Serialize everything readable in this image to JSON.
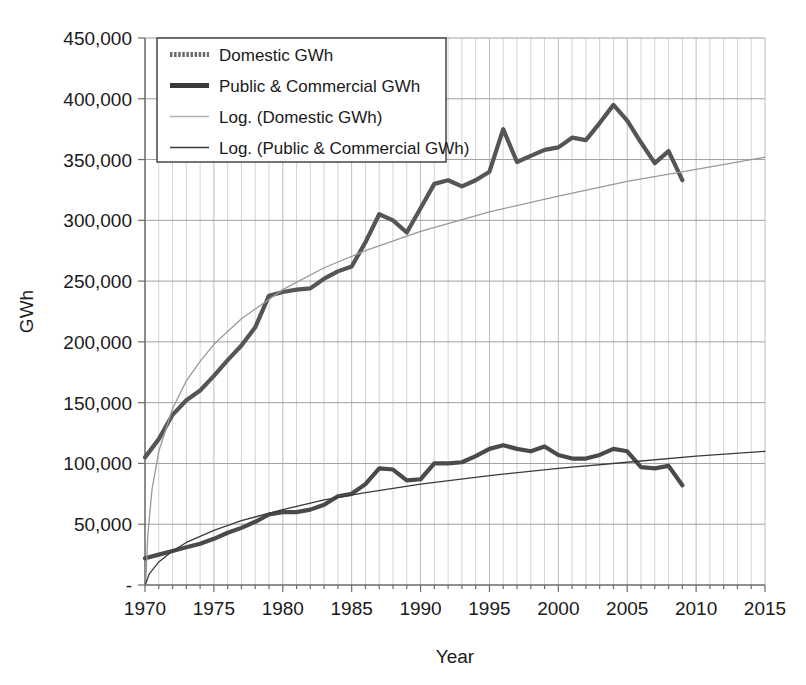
{
  "chart_data": {
    "type": "line",
    "title": "",
    "xlabel": "Year",
    "ylabel": "GWh",
    "xlim": [
      1970,
      2015
    ],
    "ylim": [
      0,
      450000
    ],
    "xticks": [
      1970,
      1975,
      1980,
      1985,
      1990,
      1995,
      2000,
      2005,
      2010,
      2015
    ],
    "xtick_labels": [
      "1970",
      "1975",
      "1980",
      "1985",
      "1990",
      "1995",
      "2000",
      "2005",
      "2010",
      "2015"
    ],
    "yticks": [
      0,
      50000,
      100000,
      150000,
      200000,
      250000,
      300000,
      350000,
      400000,
      450000
    ],
    "ytick_labels": [
      "-",
      "50,000",
      "100,000",
      "150,000",
      "200,000",
      "250,000",
      "300,000",
      "350,000",
      "400,000",
      "450,000"
    ],
    "minor_x_step": 1,
    "grid": "major horizontal and minor vertical",
    "legend_position": "top-left inside plot",
    "series": [
      {
        "name": "Domestic GWh",
        "kind": "data",
        "color": "#555555",
        "width": 4.2,
        "x": [
          1970,
          1971,
          1972,
          1973,
          1974,
          1975,
          1976,
          1977,
          1978,
          1979,
          1980,
          1981,
          1982,
          1983,
          1984,
          1985,
          1986,
          1987,
          1988,
          1989,
          1990,
          1991,
          1992,
          1993,
          1994,
          1995,
          1996,
          1997,
          1998,
          1999,
          2000,
          2001,
          2002,
          2003,
          2004,
          2005,
          2006,
          2007,
          2008,
          2009
        ],
        "values": [
          105000,
          120000,
          140000,
          152000,
          160000,
          172000,
          185000,
          197000,
          212000,
          238000,
          241000,
          243000,
          244000,
          252000,
          258000,
          262000,
          282000,
          305000,
          300000,
          290000,
          310000,
          330000,
          333000,
          328000,
          333000,
          340000,
          375000,
          348000,
          353000,
          358000,
          360000,
          368000,
          366000,
          380000,
          395000,
          382000,
          364000,
          347000,
          357000,
          333000
        ]
      },
      {
        "name": "Public & Commercial GWh",
        "kind": "data",
        "color": "#4a4a4a",
        "width": 4.2,
        "x": [
          1970,
          1971,
          1972,
          1973,
          1974,
          1975,
          1976,
          1977,
          1978,
          1979,
          1980,
          1981,
          1982,
          1983,
          1984,
          1985,
          1986,
          1987,
          1988,
          1989,
          1990,
          1991,
          1992,
          1993,
          1994,
          1995,
          1996,
          1997,
          1998,
          1999,
          2000,
          2001,
          2002,
          2003,
          2004,
          2005,
          2006,
          2007,
          2008,
          2009
        ],
        "values": [
          22000,
          25000,
          28000,
          31000,
          34000,
          38000,
          43000,
          47000,
          52000,
          58000,
          60000,
          60000,
          62000,
          66000,
          73000,
          75000,
          83000,
          96000,
          95000,
          86000,
          87000,
          100000,
          100000,
          101000,
          106000,
          112000,
          115000,
          112000,
          110000,
          114000,
          107000,
          104000,
          104000,
          107000,
          112000,
          110000,
          97000,
          96000,
          98000,
          82000
        ]
      },
      {
        "name": "Log. (Domestic GWh)",
        "kind": "trend",
        "color": "#999999",
        "width": 1.3,
        "fit": "logarithmic",
        "x": [
          1970.05,
          1970.2,
          1970.5,
          1971,
          1972,
          1973,
          1974,
          1975,
          1977,
          1980,
          1983,
          1986,
          1990,
          1995,
          2000,
          2005,
          2010,
          2015
        ],
        "values": [
          2000,
          40000,
          78000,
          110000,
          145000,
          168000,
          184000,
          198000,
          219000,
          243000,
          261000,
          275000,
          291000,
          307000,
          320000,
          332000,
          342000,
          352000
        ]
      },
      {
        "name": "Log. (Public & Commercial GWh)",
        "kind": "trend",
        "color": "#3a3a3a",
        "width": 1.3,
        "fit": "logarithmic",
        "x": [
          1970.05,
          1970.3,
          1971,
          1972,
          1973,
          1975,
          1977,
          1980,
          1983,
          1986,
          1990,
          1995,
          2000,
          2005,
          2010,
          2015
        ],
        "values": [
          1000,
          9000,
          19000,
          28000,
          35000,
          45000,
          53000,
          62000,
          70000,
          76000,
          83000,
          90000,
          96000,
          101000,
          106000,
          110000
        ]
      }
    ],
    "legend_entries": [
      {
        "label": "Domestic GWh",
        "style": "thick-dotted",
        "color": "#6b6b6b",
        "width": 5
      },
      {
        "label": "Public & Commercial GWh",
        "style": "thick-solid",
        "color": "#3a3a3a",
        "width": 5
      },
      {
        "label": "Log. (Domestic GWh)",
        "style": "thin-light",
        "color": "#b0b0b0",
        "width": 1.4
      },
      {
        "label": "Log. (Public & Commercial GWh)",
        "style": "thin-solid",
        "color": "#3a3a3a",
        "width": 1.4
      }
    ]
  },
  "plot": {
    "left": 145,
    "right": 765,
    "top": 38,
    "bottom": 585,
    "grid_color": "#9aa0a6",
    "minor_grid_color": "#d4d4d4",
    "axis_color": "#6b6b6b",
    "background": "#ffffff"
  },
  "legend_box": {
    "x": 157,
    "y": 38,
    "width": 289,
    "height": 124,
    "border_color": "#3a3a3a",
    "background": "#ffffff"
  }
}
